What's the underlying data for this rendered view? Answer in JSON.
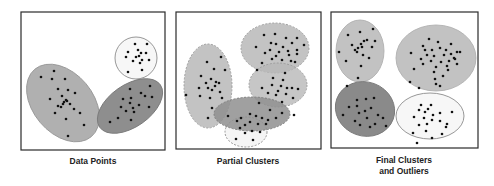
{
  "colors": {
    "border": "#2b2b2b",
    "dot": "#111111",
    "light_gray": "#c4c4c4",
    "mid_gray": "#a9a9a9",
    "dark_gray": "#8a8a8a",
    "white_fill": "#f7f7f7",
    "outline": "#8c8c8c"
  },
  "panels": [
    {
      "id": "data-points",
      "caption_lines": [
        "Data Points"
      ],
      "frame": {
        "x": 21,
        "y": 12,
        "w": 144,
        "h": 138
      },
      "caption_pos": {
        "x": 93,
        "y": 156
      },
      "shapes": [
        {
          "name": "large-tilted-ellipse",
          "cx": 63,
          "cy": 103,
          "rx": 44,
          "ry": 30,
          "rot": 50,
          "fill": "#b0b0b0",
          "stroke": "#999",
          "dashed": false,
          "opacity": 1
        },
        {
          "name": "small-white-circle",
          "cx": 136,
          "cy": 58,
          "rx": 21,
          "ry": 21,
          "rot": 0,
          "fill": "#f7f7f7",
          "stroke": "#8c8c8c",
          "dashed": false,
          "opacity": 1
        },
        {
          "name": "dark-tilted-ellipse",
          "cx": 130,
          "cy": 106,
          "rx": 37,
          "ry": 21,
          "rot": -35,
          "fill": "#8e8e8e",
          "stroke": "#7a7a7a",
          "dashed": false,
          "opacity": 1
        }
      ],
      "dots": [
        [
          41,
          77
        ],
        [
          54,
          71
        ],
        [
          52,
          79
        ],
        [
          65,
          79
        ],
        [
          58,
          89
        ],
        [
          68,
          90
        ],
        [
          75,
          93
        ],
        [
          62,
          96
        ],
        [
          50,
          99
        ],
        [
          66,
          100
        ],
        [
          64,
          102
        ],
        [
          67,
          101
        ],
        [
          63,
          104
        ],
        [
          61,
          107
        ],
        [
          70,
          104
        ],
        [
          58,
          106
        ],
        [
          74,
          109
        ],
        [
          55,
          113
        ],
        [
          80,
          113
        ],
        [
          66,
          119
        ],
        [
          84,
          125
        ],
        [
          68,
          136
        ],
        [
          135,
          44
        ],
        [
          147,
          44
        ],
        [
          128,
          52
        ],
        [
          138,
          50
        ],
        [
          141,
          53
        ],
        [
          139,
          56
        ],
        [
          146,
          53
        ],
        [
          126,
          57
        ],
        [
          136,
          57
        ],
        [
          133,
          61
        ],
        [
          142,
          60
        ],
        [
          149,
          60
        ],
        [
          140,
          63
        ],
        [
          128,
          72
        ],
        [
          142,
          70
        ],
        [
          130,
          89
        ],
        [
          150,
          86
        ],
        [
          141,
          93
        ],
        [
          123,
          99
        ],
        [
          131,
          98
        ],
        [
          145,
          96
        ],
        [
          152,
          97
        ],
        [
          121,
          107
        ],
        [
          130,
          103
        ],
        [
          133,
          108
        ],
        [
          139,
          105
        ],
        [
          149,
          107
        ],
        [
          126,
          111
        ],
        [
          134,
          112
        ],
        [
          118,
          118
        ],
        [
          131,
          120
        ],
        [
          110,
          122
        ]
      ]
    },
    {
      "id": "partial-clusters",
      "caption_lines": [
        "Partial Clusters"
      ],
      "frame": {
        "x": 176,
        "y": 12,
        "w": 145,
        "h": 137
      },
      "caption_pos": {
        "x": 248,
        "y": 156
      },
      "shapes": [
        {
          "name": "left-vertical-ellipse",
          "cx": 208,
          "cy": 86,
          "rx": 24,
          "ry": 42,
          "rot": 0,
          "fill": "#b8b8b8",
          "stroke": "#999",
          "dashed": true,
          "opacity": 0.85
        },
        {
          "name": "top-right-ellipse",
          "cx": 275,
          "cy": 48,
          "rx": 34,
          "ry": 25,
          "rot": 0,
          "fill": "#b8b8b8",
          "stroke": "#999",
          "dashed": true,
          "opacity": 0.85
        },
        {
          "name": "middle-right-ellipse",
          "cx": 278,
          "cy": 85,
          "rx": 29,
          "ry": 22,
          "rot": 0,
          "fill": "#b8b8b8",
          "stroke": "#999",
          "dashed": true,
          "opacity": 0.8
        },
        {
          "name": "bottom-white-circle",
          "cx": 246,
          "cy": 132,
          "rx": 21,
          "ry": 15,
          "rot": 0,
          "fill": "#f5f5f5",
          "stroke": "#8c8c8c",
          "dashed": true,
          "opacity": 1
        },
        {
          "name": "dark-horizontal-ellipse",
          "cx": 252,
          "cy": 114,
          "rx": 38,
          "ry": 17,
          "rot": 0,
          "fill": "#8f8f8f",
          "stroke": "#7a7a7a",
          "dashed": true,
          "opacity": 0.85
        }
      ],
      "dots": [
        [
          207,
          62
        ],
        [
          221,
          57
        ],
        [
          214,
          69
        ],
        [
          225,
          70
        ],
        [
          201,
          76
        ],
        [
          211,
          79
        ],
        [
          216,
          82
        ],
        [
          219,
          83
        ],
        [
          206,
          83
        ],
        [
          208,
          88
        ],
        [
          199,
          88
        ],
        [
          212,
          90
        ],
        [
          220,
          92
        ],
        [
          215,
          86
        ],
        [
          200,
          96
        ],
        [
          186,
          95
        ],
        [
          210,
          98
        ],
        [
          222,
          98
        ],
        [
          212,
          108
        ],
        [
          208,
          118
        ],
        [
          264,
          35
        ],
        [
          275,
          34
        ],
        [
          286,
          38
        ],
        [
          297,
          38
        ],
        [
          271,
          43
        ],
        [
          276,
          44
        ],
        [
          283,
          47
        ],
        [
          292,
          43
        ],
        [
          256,
          47
        ],
        [
          270,
          50
        ],
        [
          279,
          52
        ],
        [
          288,
          51
        ],
        [
          297,
          50
        ],
        [
          304,
          45
        ],
        [
          265,
          53
        ],
        [
          276,
          56
        ],
        [
          289,
          55
        ],
        [
          297,
          54
        ],
        [
          272,
          59
        ],
        [
          282,
          60
        ],
        [
          291,
          61
        ],
        [
          262,
          63
        ],
        [
          257,
          70
        ],
        [
          295,
          62
        ],
        [
          285,
          73
        ],
        [
          273,
          78
        ],
        [
          283,
          80
        ],
        [
          272,
          85
        ],
        [
          281,
          86
        ],
        [
          287,
          88
        ],
        [
          278,
          91
        ],
        [
          292,
          88
        ],
        [
          262,
          88
        ],
        [
          298,
          89
        ],
        [
          268,
          93
        ],
        [
          276,
          95
        ],
        [
          286,
          94
        ],
        [
          293,
          98
        ],
        [
          282,
          102
        ],
        [
          259,
          103
        ],
        [
          270,
          110
        ],
        [
          282,
          113
        ],
        [
          294,
          115
        ],
        [
          241,
          118
        ],
        [
          250,
          114
        ],
        [
          256,
          116
        ],
        [
          262,
          118
        ],
        [
          268,
          120
        ],
        [
          276,
          118
        ],
        [
          250,
          122
        ],
        [
          258,
          124
        ],
        [
          266,
          124
        ],
        [
          245,
          125
        ],
        [
          237,
          121
        ],
        [
          228,
          116
        ],
        [
          240,
          128
        ],
        [
          252,
          131
        ],
        [
          260,
          132
        ],
        [
          245,
          133
        ],
        [
          236,
          139
        ],
        [
          253,
          140
        ]
      ]
    },
    {
      "id": "final-clusters-and-outliers",
      "caption_lines": [
        "Final Clusters",
        "and Outliers"
      ],
      "frame": {
        "x": 331,
        "y": 12,
        "w": 147,
        "h": 136
      },
      "caption_pos": {
        "x": 404,
        "y": 155
      },
      "shapes": [
        {
          "name": "top-left-ellipse",
          "cx": 360,
          "cy": 51,
          "rx": 24,
          "ry": 31,
          "rot": 0,
          "fill": "#c2c2c2",
          "stroke": "#b0b0b0",
          "dashed": false,
          "opacity": 1
        },
        {
          "name": "top-right-ellipse",
          "cx": 436,
          "cy": 58,
          "rx": 40,
          "ry": 33,
          "rot": 0,
          "fill": "#c2c2c2",
          "stroke": "#b0b0b0",
          "dashed": false,
          "opacity": 1
        },
        {
          "name": "bottom-left-dark-ellipse",
          "cx": 365,
          "cy": 109,
          "rx": 30,
          "ry": 27,
          "rot": 20,
          "fill": "#8a8a8a",
          "stroke": "#7a7a7a",
          "dashed": false,
          "opacity": 1
        },
        {
          "name": "bottom-right-white-ellipse",
          "cx": 430,
          "cy": 116,
          "rx": 34,
          "ry": 23,
          "rot": 0,
          "fill": "#f7f7f7",
          "stroke": "#8c8c8c",
          "dashed": false,
          "opacity": 1
        }
      ],
      "dots": [
        [
          373,
          29
        ],
        [
          348,
          35
        ],
        [
          360,
          32
        ],
        [
          364,
          41
        ],
        [
          352,
          45
        ],
        [
          361,
          44
        ],
        [
          367,
          40
        ],
        [
          355,
          50
        ],
        [
          358,
          48
        ],
        [
          362,
          47
        ],
        [
          357,
          52
        ],
        [
          372,
          47
        ],
        [
          339,
          52
        ],
        [
          363,
          55
        ],
        [
          346,
          61
        ],
        [
          369,
          58
        ],
        [
          375,
          41
        ],
        [
          361,
          66
        ],
        [
          358,
          78
        ],
        [
          429,
          39
        ],
        [
          438,
          42
        ],
        [
          451,
          44
        ],
        [
          423,
          46
        ],
        [
          425,
          50
        ],
        [
          432,
          50
        ],
        [
          440,
          48
        ],
        [
          446,
          50
        ],
        [
          451,
          54
        ],
        [
          457,
          52
        ],
        [
          411,
          53
        ],
        [
          427,
          55
        ],
        [
          434,
          56
        ],
        [
          444,
          55
        ],
        [
          454,
          58
        ],
        [
          460,
          52
        ],
        [
          421,
          59
        ],
        [
          431,
          61
        ],
        [
          441,
          62
        ],
        [
          449,
          61
        ],
        [
          455,
          59
        ],
        [
          423,
          64
        ],
        [
          436,
          67
        ],
        [
          447,
          66
        ],
        [
          457,
          64
        ],
        [
          414,
          69
        ],
        [
          434,
          72
        ],
        [
          448,
          70
        ],
        [
          443,
          76
        ],
        [
          435,
          79
        ],
        [
          410,
          82
        ],
        [
          436,
          84
        ],
        [
          419,
          88
        ],
        [
          440,
          86
        ],
        [
          347,
          86
        ],
        [
          357,
          100
        ],
        [
          366,
          99
        ],
        [
          374,
          98
        ],
        [
          349,
          107
        ],
        [
          357,
          106
        ],
        [
          365,
          111
        ],
        [
          371,
          108
        ],
        [
          378,
          115
        ],
        [
          359,
          113
        ],
        [
          367,
          118
        ],
        [
          355,
          121
        ],
        [
          383,
          118
        ],
        [
          375,
          124
        ],
        [
          370,
          127
        ],
        [
          343,
          115
        ],
        [
          360,
          125
        ],
        [
          386,
          126
        ],
        [
          421,
          105
        ],
        [
          431,
          105
        ],
        [
          419,
          110
        ],
        [
          425,
          112
        ],
        [
          428,
          109
        ],
        [
          433,
          115
        ],
        [
          440,
          113
        ],
        [
          452,
          112
        ],
        [
          414,
          117
        ],
        [
          424,
          118
        ],
        [
          432,
          120
        ],
        [
          427,
          124
        ],
        [
          440,
          121
        ],
        [
          447,
          124
        ],
        [
          419,
          125
        ],
        [
          446,
          127
        ],
        [
          426,
          131
        ],
        [
          413,
          133
        ],
        [
          432,
          138
        ],
        [
          417,
          143
        ],
        [
          442,
          134
        ]
      ]
    }
  ]
}
